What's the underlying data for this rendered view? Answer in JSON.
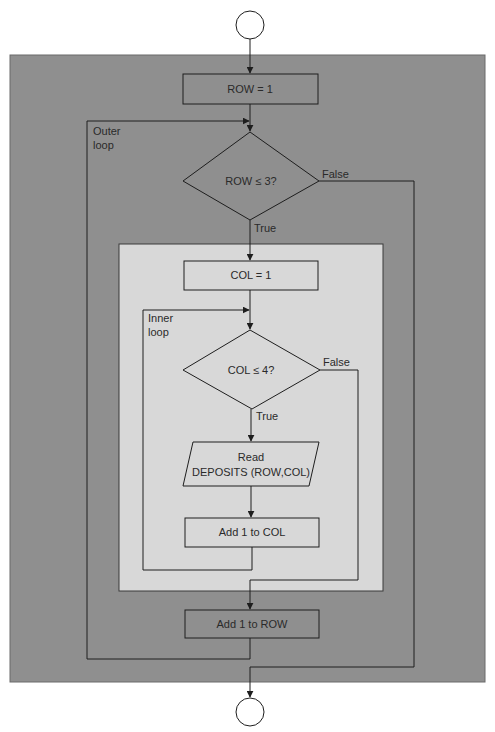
{
  "diagram": {
    "type": "flowchart",
    "colors": {
      "outer_panel": "#8f8f8f",
      "inner_panel": "#d8d8d8",
      "line": "#1e1e1e",
      "background": "#ffffff"
    },
    "start_terminal": {
      "shape": "circle",
      "label": ""
    },
    "end_terminal": {
      "shape": "circle",
      "label": ""
    },
    "nodes": {
      "row_init": {
        "shape": "process",
        "label": "ROW = 1"
      },
      "row_check": {
        "shape": "decision",
        "label": "ROW ≤ 3?",
        "true_label": "True",
        "false_label": "False"
      },
      "col_init": {
        "shape": "process",
        "label": "COL = 1"
      },
      "col_check": {
        "shape": "decision",
        "label": "COL ≤ 4?",
        "true_label": "True",
        "false_label": "False"
      },
      "read_deposits": {
        "shape": "input-output",
        "line1": "Read",
        "line2": "DEPOSITS (ROW,COL)"
      },
      "add_col": {
        "shape": "process",
        "label": "Add 1 to COL"
      },
      "add_row": {
        "shape": "process",
        "label": "Add 1 to ROW"
      }
    },
    "loops": {
      "outer": {
        "line1": "Outer",
        "line2": "loop"
      },
      "inner": {
        "line1": "Inner",
        "line2": "loop"
      }
    }
  }
}
